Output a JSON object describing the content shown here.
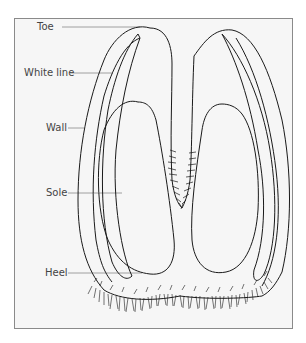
{
  "diagram": {
    "labels": [
      {
        "id": "toe",
        "text": "Toe"
      },
      {
        "id": "white-line",
        "text": "White line"
      },
      {
        "id": "wall",
        "text": "Wall"
      },
      {
        "id": "sole",
        "text": "Sole"
      },
      {
        "id": "heel",
        "text": "Heel"
      }
    ],
    "colors": {
      "background": "#f6f6f6",
      "frame": "#8a8a8a",
      "ink": "#1a1a1a",
      "leader": "#8a8a8a",
      "label": "#444444"
    }
  }
}
